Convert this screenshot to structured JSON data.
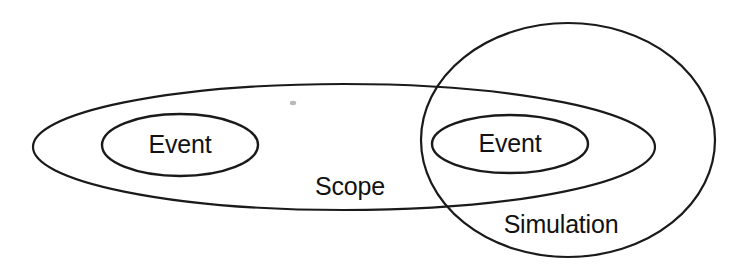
{
  "diagram": {
    "background_color": "#ffffff",
    "stroke_color": "#1a1a1a",
    "text_color": "#121212",
    "shapes": [
      {
        "id": "simulation",
        "label": "Simulation",
        "type": "ellipse",
        "cx": 568,
        "cy": 140,
        "rx": 147,
        "ry": 117,
        "stroke_width": 2.2,
        "label_x": 561,
        "label_y": 226
      },
      {
        "id": "scope",
        "label": "Scope",
        "type": "ellipse",
        "cx": 344,
        "cy": 147,
        "rx": 311,
        "ry": 63,
        "stroke_width": 2.2,
        "label_x": 350,
        "label_y": 188
      },
      {
        "id": "event-left",
        "label": "Event",
        "type": "ellipse",
        "cx": 180,
        "cy": 145,
        "rx": 78,
        "ry": 31,
        "stroke_width": 2.4,
        "label_x": 180,
        "label_y": 146
      },
      {
        "id": "event-right",
        "label": "Event",
        "type": "ellipse",
        "cx": 510,
        "cy": 144,
        "rx": 78,
        "ry": 29,
        "stroke_width": 2.4,
        "label_x": 510,
        "label_y": 145
      }
    ]
  }
}
